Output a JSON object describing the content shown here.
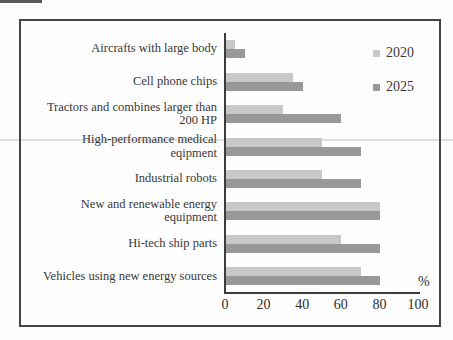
{
  "window": {
    "background": "#fdfdfd",
    "frame_border_color": "#454545"
  },
  "chart_data": {
    "type": "bar",
    "orientation": "horizontal",
    "title": "",
    "xlabel": "%",
    "ylabel": "",
    "xlim": [
      0,
      100
    ],
    "ticks": [
      0,
      20,
      40,
      60,
      80,
      100
    ],
    "grid": false,
    "legend_position": "top-right",
    "axis_color": "#3c3c3c",
    "categories": [
      "Aircrafts with large body",
      "Cell phone chips",
      "Tractors and combines larger than 200 HP",
      "High-performance medical eqipment",
      "Industrial robots",
      "New and renewable energy equipment",
      "Hi-tech ship parts",
      "Vehicles using new energy sources"
    ],
    "label_lines": [
      [
        "Aircrafts with large body"
      ],
      [
        "Cell phone chips"
      ],
      [
        "Tractors and combines larger than",
        "200 HP"
      ],
      [
        "High-performance medical",
        "eqipment"
      ],
      [
        "Industrial robots"
      ],
      [
        "New and renewable energy",
        "equipment"
      ],
      [
        "Hi-tech ship parts"
      ],
      [
        "Vehicles using new energy sources"
      ]
    ],
    "series": [
      {
        "name": "2020",
        "color": "#c8c8c8",
        "values": [
          5,
          35,
          30,
          50,
          50,
          80,
          60,
          70
        ]
      },
      {
        "name": "2025",
        "color": "#989898",
        "values": [
          10,
          40,
          60,
          70,
          70,
          80,
          80,
          80
        ]
      }
    ]
  }
}
